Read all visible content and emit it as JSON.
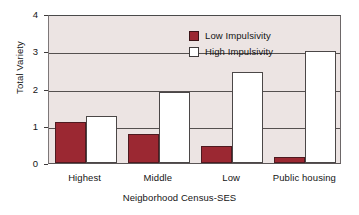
{
  "chart_data": {
    "type": "bar",
    "title": "",
    "subtitle": "",
    "xlabel": "Neigborhood Census-SES",
    "ylabel": "Total Variety",
    "categories": [
      "Highest",
      "Middle",
      "Low",
      "Public housing"
    ],
    "series": [
      {
        "name": "Low Impulsivity",
        "color": "#9B2832",
        "values": [
          1.1,
          0.78,
          0.47,
          0.17
        ]
      },
      {
        "name": "High Impulsivity",
        "color": "#FFFFFF",
        "values": [
          1.25,
          1.9,
          2.45,
          3.02
        ]
      }
    ],
    "ylim": [
      0,
      4
    ],
    "yticks": [
      0,
      1,
      2,
      3,
      4
    ],
    "ytick_labels": [
      "0",
      "1",
      "2",
      "3",
      "4"
    ],
    "grid": "horizontal",
    "legend_position": "top-center-inside",
    "plot_background": "#ECE4E3",
    "page_background": "#FFFFFF"
  },
  "axes": {
    "y_label": "Total Variety",
    "x_label": "Neigborhood Census-SES",
    "y_ticks": [
      "0",
      "1",
      "2",
      "3",
      "4"
    ],
    "x_ticks": [
      "Highest",
      "Middle",
      "Low",
      "Public housing"
    ]
  },
  "legend": {
    "items": [
      {
        "label": "Low Impulsivity",
        "swatch": "low"
      },
      {
        "label": "High Impulsivity",
        "swatch": "high"
      }
    ]
  }
}
